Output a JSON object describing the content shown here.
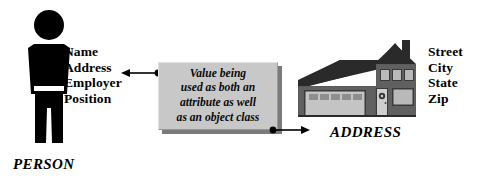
{
  "diagram": {
    "background_color": "#ffffff",
    "ink_color": "#000000",
    "box_fill_color": "#c8c8c8",
    "box_shadow_color": "#7b7b7b",
    "person": {
      "icon": "person-silhouette-icon",
      "caption": "PERSON",
      "attributes": [
        "Name",
        "Address",
        "Employer",
        "Position"
      ]
    },
    "address": {
      "icon": "house-icon",
      "caption": "ADDRESS",
      "attributes": [
        "Street",
        "City",
        "State",
        "Zip"
      ]
    },
    "annotation": {
      "lines": [
        "Value being",
        "used as both an",
        "attribute as well",
        "as an object class"
      ]
    },
    "connectors": {
      "left": {
        "name": "arrow-to-person-address-attribute",
        "direction": "left",
        "from": "annotation-box",
        "to": "Address"
      },
      "right": {
        "name": "arrow-to-address-object-class",
        "direction": "right",
        "from": "annotation-box",
        "to": "ADDRESS"
      }
    }
  }
}
